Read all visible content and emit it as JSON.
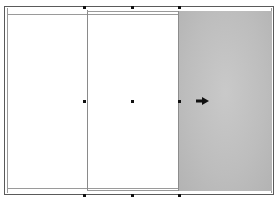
{
  "canvas": {
    "background": "#ffffff",
    "frame_color": "#5a5a5a",
    "margin_color": "#9a9a9a"
  },
  "page": {
    "columns": [
      {
        "name": "left-column",
        "fill": "#ffffff"
      },
      {
        "name": "middle-column",
        "fill": "#ffffff"
      },
      {
        "name": "right-panel",
        "fill": "#bdbdbd"
      }
    ]
  },
  "selection": {
    "handles": [
      {
        "position": "top-left",
        "x": 84,
        "y": 7
      },
      {
        "position": "top-center",
        "x": 132,
        "y": 7
      },
      {
        "position": "top-right",
        "x": 179,
        "y": 7
      },
      {
        "position": "middle-left",
        "x": 84,
        "y": 101
      },
      {
        "position": "center",
        "x": 132,
        "y": 101
      },
      {
        "position": "middle-right",
        "x": 179,
        "y": 101
      },
      {
        "position": "bottom-left",
        "x": 84,
        "y": 195
      },
      {
        "position": "bottom-center",
        "x": 132,
        "y": 195
      },
      {
        "position": "bottom-right",
        "x": 179,
        "y": 195
      }
    ],
    "handle_color": "#111111"
  },
  "indicator": {
    "icon": "arrow-right-icon",
    "color": "#111111"
  }
}
